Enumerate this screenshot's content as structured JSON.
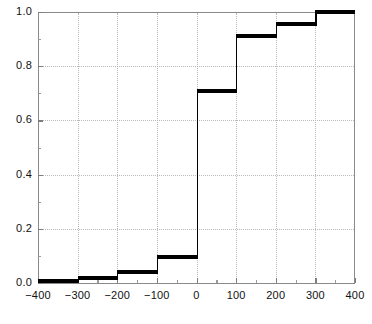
{
  "chart_data": {
    "type": "line",
    "subtype": "step-ecdf",
    "title": "",
    "xlabel": "",
    "ylabel": "",
    "xlim": [
      -400,
      400
    ],
    "ylim": [
      0.0,
      1.0
    ],
    "grid": true,
    "legend": null,
    "x_ticks": [
      -400,
      -300,
      -200,
      -100,
      0,
      100,
      200,
      300,
      400
    ],
    "x_tick_labels": [
      "-400",
      "-300",
      "-200",
      "-100",
      "0",
      "100",
      "200",
      "300",
      "400"
    ],
    "x_minor_ticks": [
      -350,
      -250,
      -150,
      -50,
      50,
      150,
      250,
      350
    ],
    "y_ticks": [
      0.0,
      0.2,
      0.4,
      0.6,
      0.8,
      1.0
    ],
    "y_tick_labels": [
      "0.0",
      "0.2",
      "0.4",
      "0.6",
      "0.8",
      "1.0"
    ],
    "y_minor_ticks": [
      0.1,
      0.3,
      0.5,
      0.7,
      0.9
    ],
    "bin_edges": [
      -400,
      -300,
      -200,
      -100,
      0,
      100,
      200,
      300,
      400
    ],
    "values": [
      0.008,
      0.018,
      0.04,
      0.095,
      0.71,
      0.91,
      0.955,
      1.0
    ],
    "steps": [
      {
        "x0": -400,
        "x1": -300,
        "y": 0.008
      },
      {
        "x0": -300,
        "x1": -200,
        "y": 0.018
      },
      {
        "x0": -200,
        "x1": -100,
        "y": 0.04
      },
      {
        "x0": -100,
        "x1": 0,
        "y": 0.095
      },
      {
        "x0": 0,
        "x1": 100,
        "y": 0.71
      },
      {
        "x0": 100,
        "x1": 200,
        "y": 0.91
      },
      {
        "x0": 200,
        "x1": 300,
        "y": 0.955
      },
      {
        "x0": 300,
        "x1": 400,
        "y": 1.0
      }
    ],
    "colors": {
      "series": "#000000",
      "grid": "#b9b9b9",
      "axis": "#8a8a8a",
      "text": "#111111",
      "background": "#ffffff"
    }
  }
}
